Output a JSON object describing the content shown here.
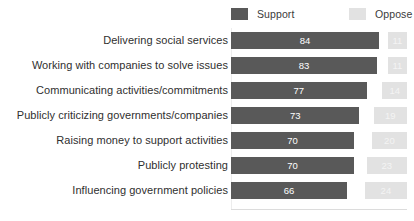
{
  "chart_data": {
    "type": "bar",
    "orientation": "horizontal",
    "title": "",
    "subtitle": "",
    "xlabel": "",
    "ylabel": "",
    "xlim": [
      0,
      100
    ],
    "grid": false,
    "legend_position": "top-right",
    "categories": [
      "Delivering social services",
      "Working with companies to solve issues",
      "Communicating activities/commitments",
      "Publicly criticizing governments/companies",
      "Raising money to support activities",
      "Publicly protesting",
      "Influencing government policies"
    ],
    "series": [
      {
        "name": "Support",
        "color": "#595959",
        "values": [
          84,
          83,
          77,
          73,
          70,
          70,
          66
        ]
      },
      {
        "name": "Oppose",
        "color": "#e2e2e2",
        "values": [
          11,
          11,
          14,
          19,
          20,
          23,
          24
        ]
      }
    ]
  },
  "legend": {
    "entries": [
      {
        "label": "Support",
        "color": "#595959"
      },
      {
        "label": "Oppose",
        "color": "#e2e2e2"
      }
    ]
  },
  "colors": {
    "support": "#595959",
    "oppose": "#e2e2e2",
    "background": "#ffffff",
    "label_text": "#2f2f2f",
    "value_text": "#ffffff",
    "axis_line": "#dcdcdc"
  }
}
